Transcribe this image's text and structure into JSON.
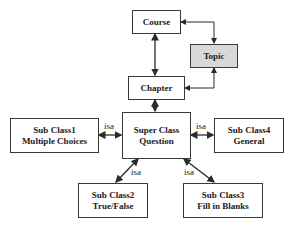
{
  "nodes": {
    "course": {
      "label": "Course"
    },
    "topic": {
      "label": "Topic"
    },
    "chapter": {
      "label": "Chapter"
    },
    "question": {
      "line1": "Super Class",
      "line2": "Question"
    },
    "sub1": {
      "line1": "Sub Class1",
      "line2": "Multiple Choices"
    },
    "sub2": {
      "line1": "Sub Class2",
      "line2": "True/False"
    },
    "sub3": {
      "line1": "Sub Class3",
      "line2": "Fill in Blanks"
    },
    "sub4": {
      "line1": "Sub Class4",
      "line2": "General"
    }
  },
  "edge_labels": {
    "sub1": "isa",
    "sub4": "isa",
    "sub2": "isa",
    "sub3": "isa"
  },
  "colors": {
    "border": "#3a3a3a",
    "topic_fill": "#d8d8d8"
  }
}
